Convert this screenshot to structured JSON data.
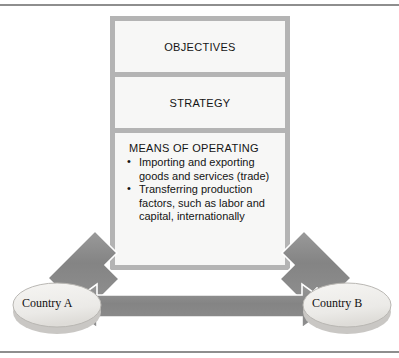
{
  "stack": {
    "objectives": {
      "title": "OBJECTIVES"
    },
    "strategy": {
      "title": "STRATEGY"
    },
    "means": {
      "title": "MEANS OF OPERATING",
      "bullets": [
        "Importing and exporting goods and services (trade)",
        "Transferring production factors, such as labor and capital, internationally"
      ]
    }
  },
  "nodes": {
    "country_a": {
      "label": "Country A"
    },
    "country_b": {
      "label": "Country B"
    }
  },
  "connectors": {
    "arrow_to_a": {
      "name": "diagonal-arrow-down-left"
    },
    "arrow_to_b": {
      "name": "diagonal-arrow-down-right"
    },
    "arrow_between": {
      "name": "double-headed-horizontal-arrow"
    }
  },
  "colors": {
    "frame_rule": "#8e8e8e",
    "stack_background": "#b4b4b4",
    "panel_background": "#f7f7f6",
    "arrow_fill": "#8a8a8a",
    "arrow_stroke": "#ffffff",
    "ellipse_fill": "#efeeec",
    "ellipse_shadow": "#c9c7c4",
    "text": "#141414"
  }
}
